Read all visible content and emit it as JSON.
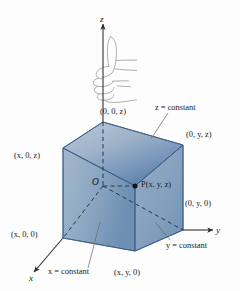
{
  "figure": {
    "background_color": "#fdfdfd",
    "axes": {
      "z_label": "z",
      "y_label": "y",
      "x_label": "x"
    },
    "origin_label": "O",
    "point_label": "P(x, y, z)",
    "vertex_labels": {
      "top_back": "(0, 0, z)",
      "top_right": "(0, y, z)",
      "top_left": "(x, 0, z)",
      "bottom_right": "(0, y, 0)",
      "bottom_left": "(x, 0, 0)",
      "bottom_front": "(x, y, 0)"
    },
    "plane_labels": {
      "z_plane": "z = constant",
      "y_plane": "y = constant",
      "x_plane": "x = constant"
    },
    "icons": {
      "hand": "thumbs-up-hand-icon",
      "point_dot": "point-marker-icon"
    },
    "colors": {
      "face_top_light": "#aebdcf",
      "face_top_dark": "#5b7fa6",
      "face_left_light": "#9fb4c9",
      "face_left_dark": "#6f91b4",
      "face_front_light": "#8fa9c4",
      "face_front_dark": "#7a9bbd",
      "edge": "#3c5f85",
      "axis": "#2a2a2a",
      "hand_outline": "#9a9a9a",
      "leader": "#6a6a6a",
      "text": "#1b1b1b"
    }
  }
}
